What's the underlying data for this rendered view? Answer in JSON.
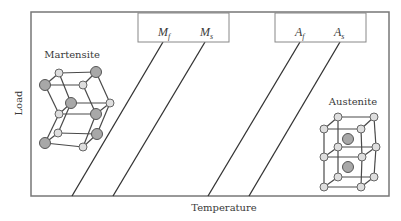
{
  "diagram": {
    "axes": {
      "x_label": "Temperature",
      "y_label": "Load"
    },
    "phases": {
      "left": "Martensite",
      "right": "Austenite"
    },
    "martensite_box": {
      "labels": [
        {
          "main": "M",
          "sub": "f"
        },
        {
          "main": "M",
          "sub": "s"
        }
      ]
    },
    "austenite_box": {
      "labels": [
        {
          "main": "A",
          "sub": "f"
        },
        {
          "main": "A",
          "sub": "s"
        }
      ]
    },
    "transformation_lines": [
      {
        "name": "Mf",
        "top": [
          163,
          42
        ],
        "bottom": [
          72,
          196
        ]
      },
      {
        "name": "Ms",
        "top": [
          205,
          42
        ],
        "bottom": [
          113,
          196
        ]
      },
      {
        "name": "Af",
        "top": [
          300,
          42
        ],
        "bottom": [
          208,
          196
        ]
      },
      {
        "name": "As",
        "top": [
          340,
          42
        ],
        "bottom": [
          249,
          196
        ]
      }
    ],
    "colors": {
      "frame": "#777777",
      "line": "#333333",
      "atom_large": "#a8a8a8",
      "atom_small": "#dedede"
    }
  }
}
